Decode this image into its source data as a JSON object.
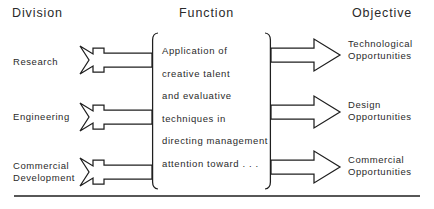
{
  "figure": {
    "background_color": "#ffffff",
    "ink_color": "#1f1f1f"
  },
  "headers": {
    "division": "Division",
    "function": "Function",
    "objective": "Objective"
  },
  "divisions": [
    {
      "label": "Research"
    },
    {
      "label": "Engineering"
    },
    {
      "label_line1": "Commercial",
      "label_line2": "Development"
    }
  ],
  "function_block": {
    "lines": [
      "Application of",
      "creative talent",
      "and evaluative",
      "techniques in",
      "directing management",
      "attention toward . . ."
    ]
  },
  "objectives": [
    {
      "line1": "Technological",
      "line2": "Opportunities"
    },
    {
      "line1": "Design",
      "line2": "Opportunities"
    },
    {
      "line1": "Commercial",
      "line2": "Opportunities"
    }
  ],
  "icons": {
    "input_arrow": "fletched-arrow-right-icon",
    "output_arrow": "hollow-arrow-right-icon",
    "left_brace": "left-brace-icon",
    "right_brace": "right-brace-icon",
    "baseline_rule": "horizontal-rule-icon"
  }
}
